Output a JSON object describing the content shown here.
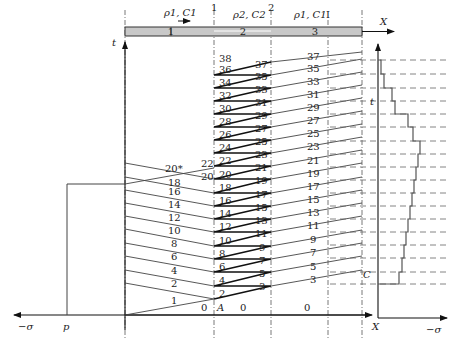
{
  "diagram": {
    "title_labels": {
      "region1": "ρ1, C1",
      "region2": "ρ2, C2",
      "region3": "ρ1, C1",
      "interface1": "1",
      "interface2": "2",
      "section_I": "I",
      "bar_seg1": "1",
      "bar_seg2": "2",
      "bar_seg3": "3"
    },
    "axes": {
      "t_left": "t",
      "x_top": "X",
      "neg_sigma_left": "−σ",
      "p_label": "p",
      "x_bottom": "X",
      "neg_sigma_right": "−σ",
      "t_right": "t"
    },
    "points": {
      "A": "A",
      "C": "C"
    },
    "zero_labels": [
      "0",
      "0",
      "0"
    ],
    "left_region_labels": [
      "1",
      "2",
      "4",
      "6",
      "8",
      "10",
      "12",
      "14",
      "16",
      "18",
      "20*"
    ],
    "interface1_left_labels": [
      "20",
      "22"
    ],
    "layer_left_labels": [
      "2",
      "4",
      "6",
      "8",
      "10",
      "12",
      "14",
      "16",
      "18",
      "20",
      "22",
      "24",
      "26",
      "28",
      "30",
      "32",
      "34",
      "36",
      "38"
    ],
    "layer_right_labels": [
      "3",
      "5",
      "7",
      "9",
      "11",
      "13",
      "15",
      "17",
      "19",
      "21",
      "23",
      "25",
      "27",
      "29",
      "31",
      "33",
      "35",
      "37"
    ],
    "right_region_labels": [
      "3",
      "5",
      "7",
      "9",
      "11",
      "13",
      "15",
      "17",
      "19",
      "21",
      "23",
      "25",
      "27",
      "29",
      "31",
      "33",
      "35",
      "37"
    ]
  }
}
